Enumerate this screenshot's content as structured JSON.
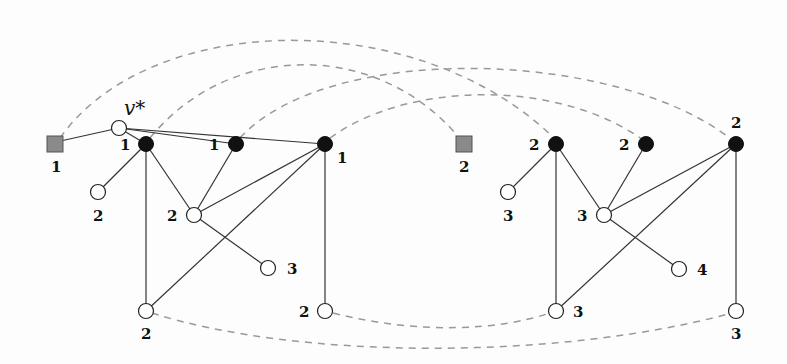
{
  "title_label": "v*",
  "nodes": {
    "vstar": {
      "label": "v*"
    },
    "sq1": {
      "label": "1"
    },
    "sq2": {
      "label": "2"
    },
    "b1a": {
      "label": "1"
    },
    "b1b": {
      "label": "1"
    },
    "b1c": {
      "label": "1"
    },
    "w1a": {
      "label": "2"
    },
    "w1mid": {
      "label": "2"
    },
    "w1r": {
      "label": "3"
    },
    "w1bl": {
      "label": "2"
    },
    "w1br": {
      "label": "2"
    },
    "b2a": {
      "label": "2"
    },
    "b2b": {
      "label": "2"
    },
    "b2c": {
      "label": "2"
    },
    "w2a": {
      "label": "3"
    },
    "w2mid": {
      "label": "3"
    },
    "w2r": {
      "label": "4"
    },
    "w2bl": {
      "label": "3"
    },
    "w2br": {
      "label": "3"
    }
  },
  "colors": {
    "edge": "#333333",
    "dashed": "#999999",
    "square": "#8a8a8a",
    "black_node": "#111111"
  }
}
